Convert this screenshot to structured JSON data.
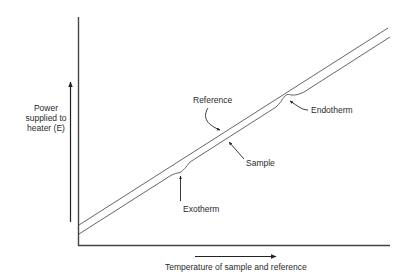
{
  "diagram": {
    "y_axis": {
      "label_lines": [
        "Power",
        "supplied to",
        "heater (E)"
      ]
    },
    "x_axis": {
      "label": "Temperature of sample and reference"
    },
    "curves": {
      "reference": {
        "label": "Reference"
      },
      "sample": {
        "label": "Sample"
      }
    },
    "annotations": {
      "exotherm": "Exotherm",
      "endotherm": "Endotherm"
    },
    "colors": {
      "line": "#555555",
      "axis": "#444444",
      "text": "#2a2a2a",
      "background": "#ffffff"
    }
  }
}
